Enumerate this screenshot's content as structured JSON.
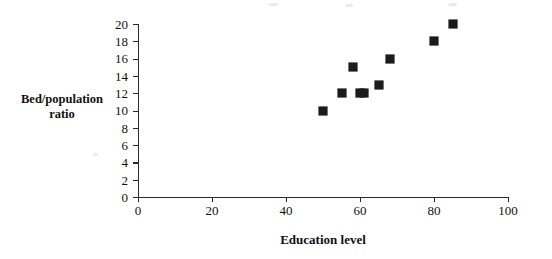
{
  "chart_data": {
    "type": "scatter",
    "title": "",
    "xlabel": "Education level",
    "ylabel": "Bed/population ratio",
    "ylabel_lines": [
      "Bed/population",
      "ratio"
    ],
    "xlim": [
      0,
      100
    ],
    "ylim": [
      0,
      20
    ],
    "x_ticks": [
      0,
      20,
      40,
      60,
      80,
      100
    ],
    "x_tick_labels": [
      "0",
      "20",
      "40",
      "60",
      "80",
      "100"
    ],
    "y_ticks": [
      0,
      2,
      4,
      6,
      8,
      10,
      12,
      14,
      16,
      18,
      20
    ],
    "y_tick_labels": [
      "0",
      "2",
      "4",
      "6",
      "8",
      "10",
      "12",
      "14",
      "16",
      "18",
      "20"
    ],
    "grid": false,
    "legend": null,
    "marker": "filled-square",
    "marker_color": "#1b1b1b",
    "points": [
      {
        "x": 50,
        "y": 10
      },
      {
        "x": 55,
        "y": 12
      },
      {
        "x": 58,
        "y": 15
      },
      {
        "x": 60,
        "y": 12
      },
      {
        "x": 61,
        "y": 12
      },
      {
        "x": 65,
        "y": 13
      },
      {
        "x": 68,
        "y": 16
      },
      {
        "x": 80,
        "y": 18
      },
      {
        "x": 85,
        "y": 20
      }
    ]
  },
  "axes": {
    "axis_color": "#2b2b2b"
  }
}
